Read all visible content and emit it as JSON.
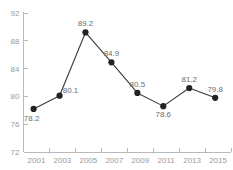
{
  "chart_data": {
    "type": "line",
    "title": "",
    "subtitle": "",
    "xlabel": "",
    "ylabel": "",
    "categories": [
      "2001",
      "2003",
      "2005",
      "2007",
      "2009",
      "2011",
      "2013",
      "2015"
    ],
    "values": [
      78.2,
      80.1,
      89.2,
      84.9,
      80.5,
      78.6,
      81.2,
      79.8
    ],
    "point_labels": [
      "78.2",
      "80.1",
      "89.2",
      "84.9",
      "80.5",
      "78.6",
      "81.2",
      "79.8"
    ],
    "label_positions": [
      "below-left",
      "above-right",
      "above",
      "above",
      "above",
      "below",
      "above",
      "above"
    ],
    "ylim": [
      72,
      92
    ],
    "y_ticks": [
      72,
      76,
      80,
      84,
      88,
      92
    ],
    "y_tick_labels": [
      "72",
      "76",
      "80",
      "84",
      "88",
      "92"
    ],
    "grid": false,
    "legend": false,
    "marker": "circle",
    "colors": {
      "line": "#3a3a3a",
      "marker": "#232323",
      "axis": "#b9b9b9",
      "tick_label": "#9a9a9a",
      "point_label": "#6d6d6d",
      "background": "#ffffff"
    }
  }
}
